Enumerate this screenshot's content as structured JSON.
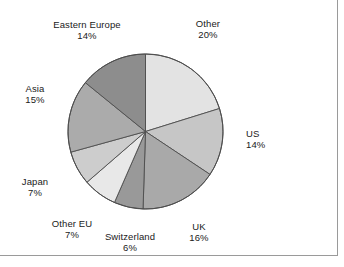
{
  "chart_data": {
    "type": "pie",
    "title": "",
    "subtitle": "",
    "xlabel": "",
    "ylabel": "",
    "legend_position": "none",
    "grid": false,
    "start_angle_deg": 0,
    "direction": "clockwise",
    "unit": "%",
    "categories": [
      "Other",
      "US",
      "UK",
      "Switzerland",
      "Other EU",
      "Japan",
      "Asia",
      "Eastern Europe"
    ],
    "values": [
      20,
      14,
      16,
      6,
      7,
      7,
      15,
      14
    ],
    "slices": [
      {
        "label": "Other",
        "value": 20,
        "value_text": "20%",
        "color": "#e3e3e3"
      },
      {
        "label": "US",
        "value": 14,
        "value_text": "14%",
        "color": "#c6c6c6"
      },
      {
        "label": "UK",
        "value": 16,
        "value_text": "16%",
        "color": "#a9a9a9"
      },
      {
        "label": "Switzerland",
        "value": 6,
        "value_text": "6%",
        "color": "#999999"
      },
      {
        "label": "Other EU",
        "value": 7,
        "value_text": "7%",
        "color": "#e8e8e8"
      },
      {
        "label": "Japan",
        "value": 7,
        "value_text": "7%",
        "color": "#cdcdcd"
      },
      {
        "label": "Asia",
        "value": 15,
        "value_text": "15%",
        "color": "#ababab"
      },
      {
        "label": "Eastern Europe",
        "value": 14,
        "value_text": "14%",
        "color": "#8d8d8d"
      }
    ],
    "colors": {
      "slice_edge": "#4d4d4d",
      "text": "#1a1a1a",
      "frame": "#9a9a9a",
      "background": "#ffffff"
    }
  }
}
